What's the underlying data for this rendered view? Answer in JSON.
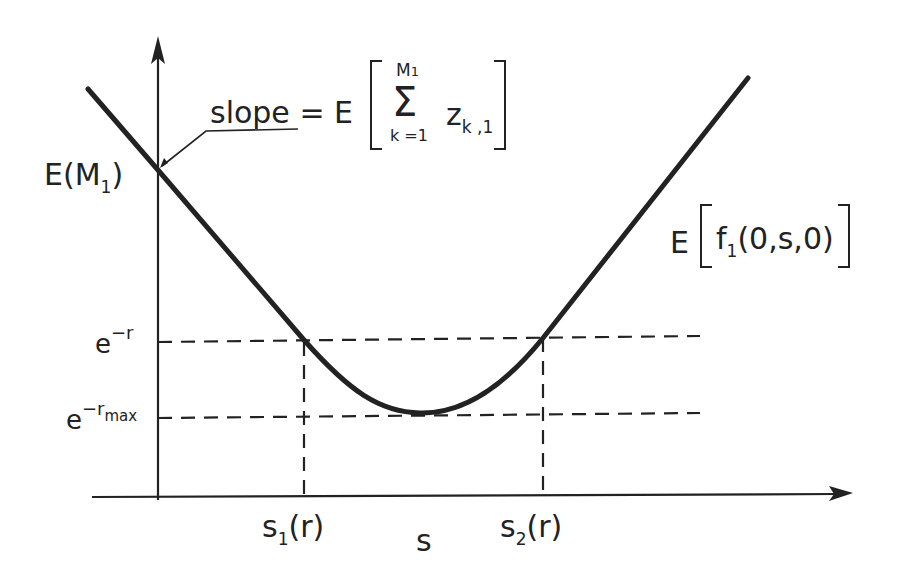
{
  "diagram": {
    "colors": {
      "ink": "#222222",
      "background": "#ffffff"
    },
    "axes": {
      "x_label": "s",
      "y_axis": "vertical arrow"
    },
    "curve_label": {
      "prefix": "E",
      "func": "f",
      "func_sub": "1",
      "args": "(0,s,0)"
    },
    "y_intercept_label": {
      "prefix": "E",
      "open": "(",
      "var": "M",
      "sub": "1",
      "close": ")"
    },
    "slope_annotation": {
      "word": "slope",
      "equals": "=",
      "op": "E",
      "sum_symbol": "Σ",
      "sum_upper": "M",
      "sum_upper_sub": "1",
      "sum_lower": "k =1",
      "term": "z",
      "term_sub": "k ,1"
    },
    "y_levels": [
      {
        "base": "e",
        "exp": "−r",
        "exp_sub": ""
      },
      {
        "base": "e",
        "exp": "−r",
        "exp_sub": "max"
      }
    ],
    "x_points": [
      {
        "var": "s",
        "sub": "1",
        "arg": "(r)"
      },
      {
        "var": "s",
        "sub": "2",
        "arg": "(r)"
      }
    ]
  }
}
